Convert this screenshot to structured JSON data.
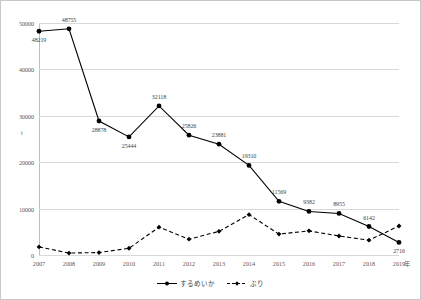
{
  "chart_data": {
    "type": "line",
    "title": "",
    "xlabel": "年",
    "ylabel": "t",
    "x": [
      2007,
      2008,
      2009,
      2010,
      2011,
      2012,
      2013,
      2014,
      2015,
      2016,
      2017,
      2018,
      2019
    ],
    "categories": [
      "2007",
      "2008",
      "2009",
      "2010",
      "2011",
      "2012",
      "2013",
      "2014",
      "2015",
      "2016",
      "2017",
      "2018",
      "2019"
    ],
    "ylim": [
      0,
      50000
    ],
    "yticks": [
      0,
      10000,
      20000,
      30000,
      40000,
      50000
    ],
    "ytick_labels": [
      "0",
      "10000",
      "20000",
      "30000",
      "40000",
      "50000"
    ],
    "grid": true,
    "legend_position": "bottom",
    "series": [
      {
        "name": "するめいか",
        "style": "solid",
        "marker": "filled-circle",
        "color": "#000000",
        "values": [
          48219,
          48755,
          28878,
          25444,
          32118,
          25826,
          23881,
          19310,
          11569,
          9382,
          8955,
          6142,
          2716
        ],
        "labels": [
          "48219",
          "48755",
          "28878",
          "25444",
          "32118",
          "25826",
          "23881",
          "19310",
          "11569",
          "9382",
          "8955",
          "6142",
          "2716"
        ]
      },
      {
        "name": "ぶり",
        "style": "dashed",
        "marker": "filled-diamond",
        "color": "#000000",
        "values": [
          1750,
          420,
          520,
          1450,
          6000,
          3400,
          5100,
          8700,
          4500,
          5200,
          4100,
          3200,
          6250
        ],
        "labels": []
      }
    ]
  },
  "axes": {
    "y_unit": "t",
    "x_unit": "年"
  },
  "legend": {
    "items": [
      {
        "label": "するめいか"
      },
      {
        "label": "ぶり"
      }
    ]
  }
}
